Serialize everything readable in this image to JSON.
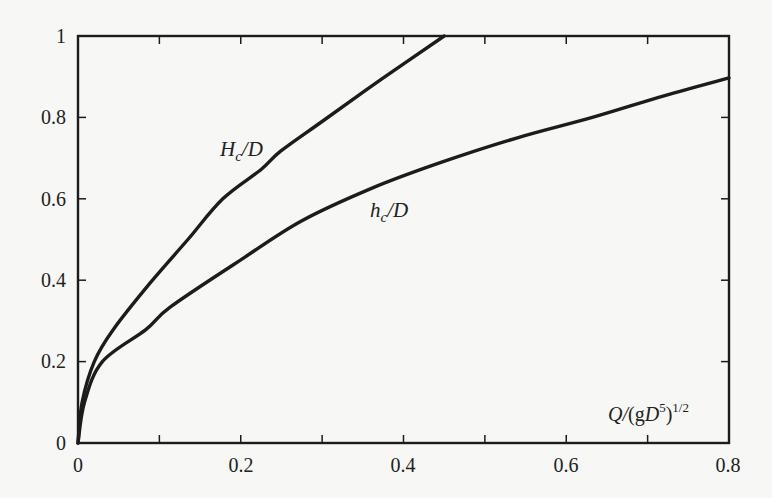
{
  "chart_data": {
    "type": "line",
    "title": "",
    "xlabel": "Q/(gD^5)^1/2",
    "ylabel": "",
    "xlim": [
      0,
      0.8
    ],
    "ylim": [
      0,
      1
    ],
    "grid": false,
    "legend": "inline curve labels",
    "x_ticks": [
      "0",
      "0.2",
      "0.4",
      "0.6",
      "0.8"
    ],
    "y_ticks": [
      "0",
      "0.2",
      "0.4",
      "0.6",
      "0.8",
      "1"
    ],
    "series": [
      {
        "name": "H_c/D",
        "label_main": "H",
        "label_sub": "c",
        "label_tail": "/D",
        "points": [
          [
            0,
            0
          ],
          [
            0.005,
            0.1
          ],
          [
            0.02,
            0.2
          ],
          [
            0.043,
            0.278
          ],
          [
            0.089,
            0.394
          ],
          [
            0.135,
            0.5
          ],
          [
            0.178,
            0.6
          ],
          [
            0.225,
            0.672
          ],
          [
            0.249,
            0.717
          ],
          [
            0.3,
            0.79
          ],
          [
            0.373,
            0.894
          ],
          [
            0.45,
            1.0
          ]
        ]
      },
      {
        "name": "h_c/D",
        "label_main": "h",
        "label_sub": "c",
        "label_tail": "/D",
        "points": [
          [
            0,
            0
          ],
          [
            0.008,
            0.1
          ],
          [
            0.03,
            0.2
          ],
          [
            0.083,
            0.278
          ],
          [
            0.114,
            0.335
          ],
          [
            0.2,
            0.45
          ],
          [
            0.274,
            0.545
          ],
          [
            0.36,
            0.625
          ],
          [
            0.447,
            0.69
          ],
          [
            0.54,
            0.75
          ],
          [
            0.632,
            0.8
          ],
          [
            0.72,
            0.853
          ],
          [
            0.8,
            0.897
          ]
        ]
      }
    ]
  }
}
